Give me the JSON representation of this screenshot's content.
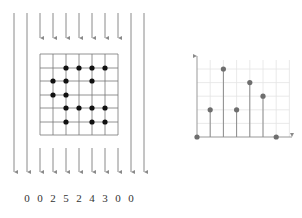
{
  "projection": {
    "description": "Parallel ray projection counting dots per column",
    "ray_x": [
      14,
      27,
      40,
      53,
      66,
      79,
      92,
      105,
      118,
      131,
      144
    ],
    "outer_ray_x": [
      14,
      27,
      131,
      144
    ],
    "inner_ray_x": [
      40,
      53,
      66,
      79,
      92,
      105,
      118
    ],
    "grid": {
      "x0": 40,
      "y0": 54,
      "cols": 6,
      "rows": 6,
      "cell": 13.1,
      "dots": [
        [
          66,
          68
        ],
        [
          79,
          68
        ],
        [
          92,
          68
        ],
        [
          105,
          68
        ],
        [
          53,
          81
        ],
        [
          66,
          81
        ],
        [
          92,
          81
        ],
        [
          53,
          95
        ],
        [
          66,
          95
        ],
        [
          66,
          108
        ],
        [
          79,
          108
        ],
        [
          92,
          108
        ],
        [
          105,
          108
        ],
        [
          66,
          122
        ],
        [
          92,
          122
        ],
        [
          105,
          122
        ]
      ]
    },
    "counts": [
      "0",
      "0",
      "2",
      "5",
      "2",
      "4",
      "3",
      "0",
      "0"
    ],
    "count_x": [
      27,
      40,
      53,
      66,
      79,
      92,
      105,
      118,
      131
    ]
  },
  "chart_data": {
    "type": "stem",
    "title": "",
    "xlabel": "",
    "ylabel": "",
    "x": [
      0,
      1,
      2,
      3,
      4,
      5,
      6
    ],
    "values": [
      0,
      2,
      5,
      2,
      4,
      3,
      0
    ],
    "ylim": [
      0,
      6
    ],
    "grid": true,
    "legend": null
  },
  "colors": {
    "ray": "#8a8a8a",
    "grid_line": "#777777",
    "dot": "#111111",
    "stem": "#8c8c8c",
    "stem_marker": "#6e6e6e",
    "chart_grid": "#e4e4e4",
    "axis": "#999999"
  }
}
